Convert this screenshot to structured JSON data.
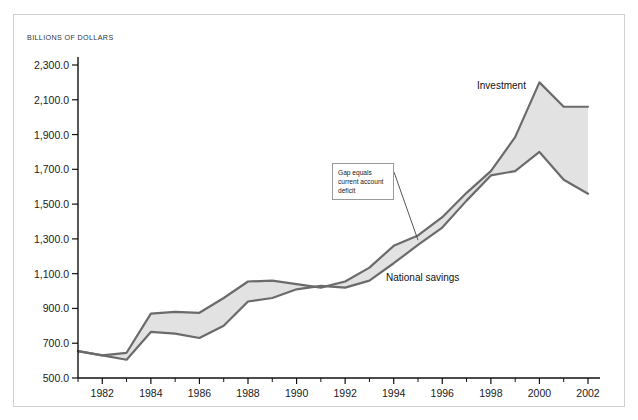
{
  "chart_data": {
    "type": "area",
    "title": "",
    "subtitle": "",
    "xlabel": "",
    "ylabel": "BILLIONS OF DOLLARS",
    "x": [
      1981,
      1982,
      1983,
      1984,
      1985,
      1986,
      1987,
      1988,
      1989,
      1990,
      1991,
      1992,
      1993,
      1994,
      1995,
      1996,
      1997,
      1998,
      1999,
      2000,
      2001,
      2002
    ],
    "xlim": [
      1981,
      2002
    ],
    "ylim": [
      500,
      2300
    ],
    "ytick_values": [
      500,
      700,
      900,
      1100,
      1300,
      1500,
      1700,
      1900,
      2100,
      2300
    ],
    "ytick_labels": [
      "500.0",
      "700.0",
      "900.0",
      "1,100.0",
      "1,300.0",
      "1,500.0",
      "1,700.0",
      "1,900.0",
      "2,100.0",
      "2,300.0"
    ],
    "xtick_values": [
      1982,
      1984,
      1986,
      1988,
      1990,
      1992,
      1994,
      1996,
      1998,
      2000,
      2002
    ],
    "xtick_labels": [
      "1982",
      "1984",
      "1986",
      "1988",
      "1990",
      "1992",
      "1994",
      "1996",
      "1998",
      "2000",
      "2002"
    ],
    "xminor_tick_values": [
      1981,
      1983,
      1985,
      1987,
      1989,
      1991,
      1993,
      1995,
      1997,
      1999,
      2001
    ],
    "grid": false,
    "legend_position": "inline-labels",
    "series": [
      {
        "name": "Investment",
        "label": "Investment",
        "color": "#6b6b6b",
        "values": [
          655,
          630,
          645,
          870,
          880,
          875,
          960,
          1055,
          1060,
          1040,
          1020,
          1055,
          1135,
          1260,
          1320,
          1425,
          1565,
          1690,
          1885,
          2200,
          2060,
          2060
        ]
      },
      {
        "name": "National savings",
        "label": "National savings",
        "color": "#6b6b6b",
        "values": [
          655,
          630,
          605,
          765,
          755,
          730,
          800,
          940,
          960,
          1010,
          1030,
          1020,
          1060,
          1160,
          1265,
          1365,
          1520,
          1665,
          1690,
          1800,
          1640,
          1560
        ]
      }
    ],
    "fill_color": "#e2e2e2",
    "line_color": "#6b6b6b",
    "annotation": {
      "lines": [
        "Gap equals",
        "current account",
        "deficit"
      ],
      "text": "Gap equals current account deficit",
      "target_year": 1995
    }
  },
  "labels": {
    "investment": "Investment",
    "national_savings": "National savings"
  }
}
